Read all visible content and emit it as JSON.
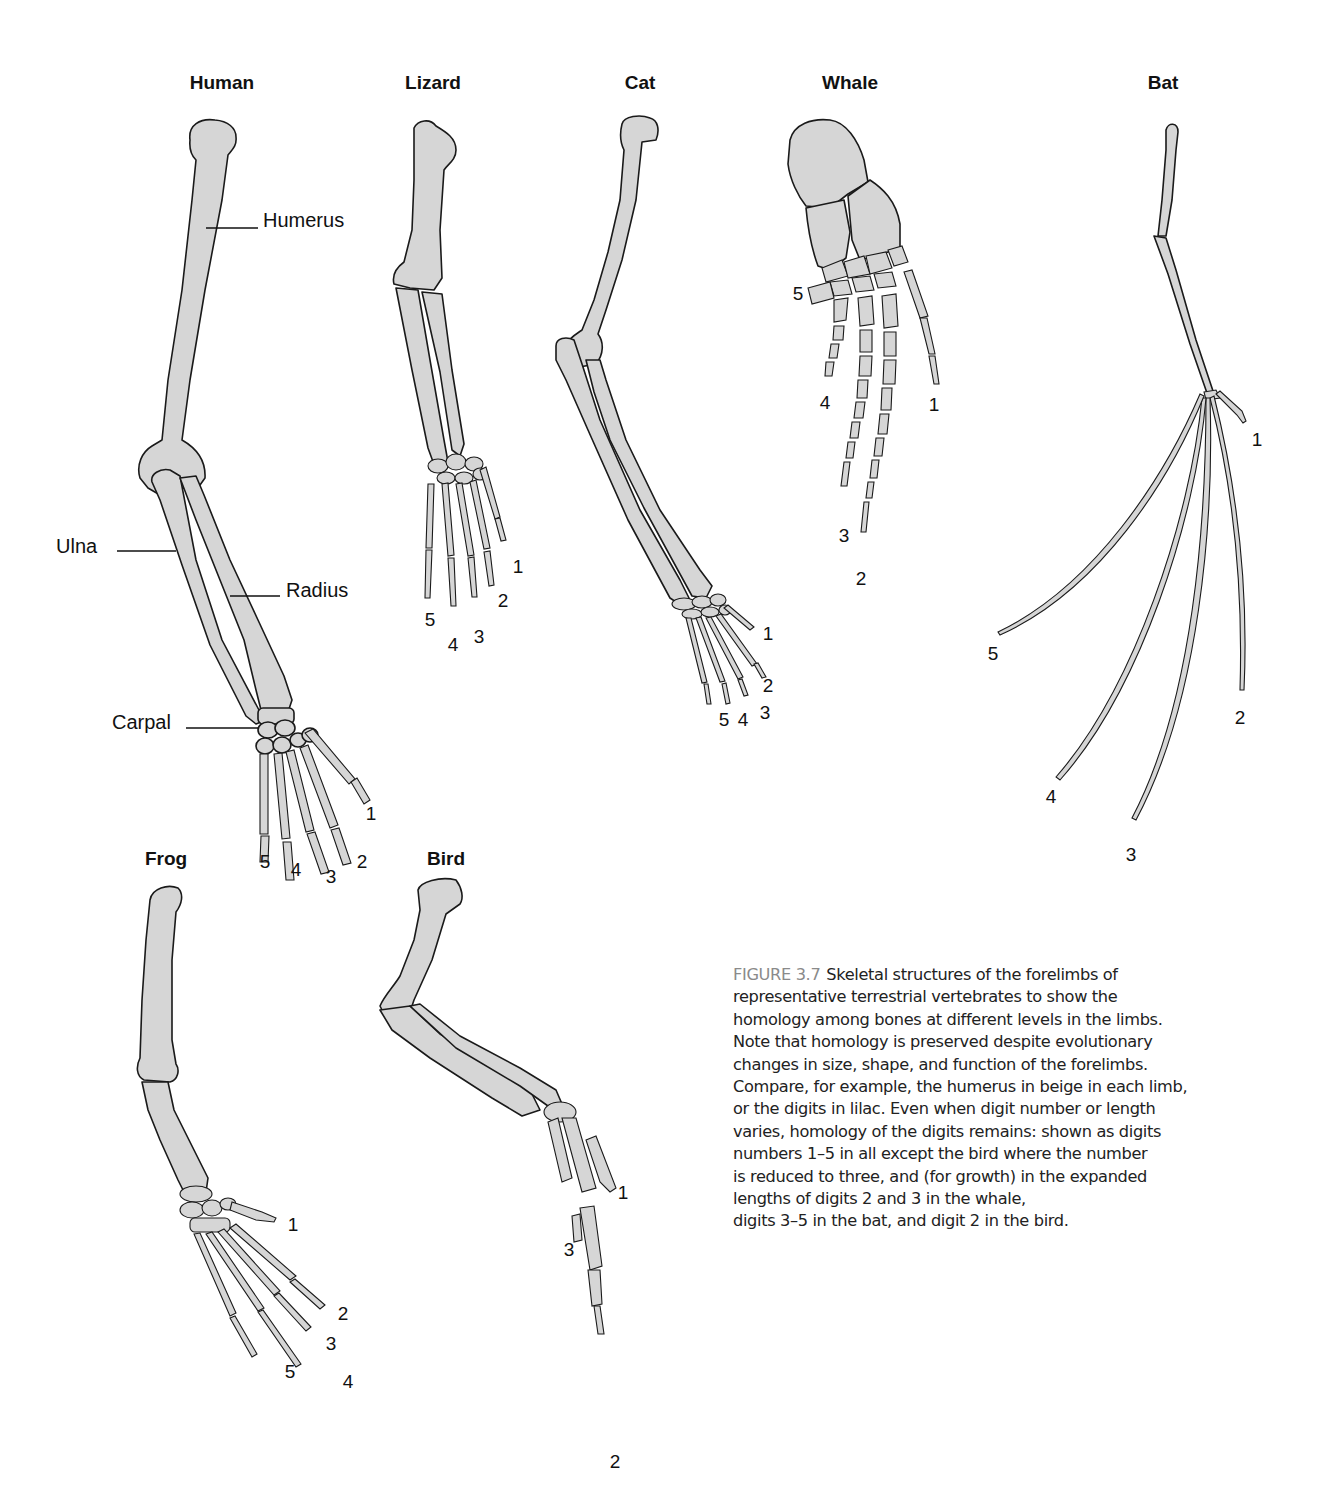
{
  "figure": {
    "number": "FIGURE 3.7",
    "caption_lines": [
      "Skeletal structures of the forelimbs of",
      "representative terrestrial vertebrates to show the",
      "homology among bones at different levels in the limbs.",
      "Note that homology is preserved despite evolutionary",
      "changes in size, shape, and function of the forelimbs.",
      "Compare, for example, the humerus in beige in each limb,",
      "or the digits in lilac. Even when digit number or length",
      "varies, homology of the digits remains: shown as digits",
      "numbers 1–5 in all except the bird where the number",
      "is reduced to three, and (for growth) in the expanded",
      "lengths of digits 2 and 3 in the whale,",
      "digits 3–5 in the bat, and digit 2 in the bird."
    ],
    "colors": {
      "bone_fill": "#d6d6d6",
      "outline": "#1a1a1a",
      "figure_number": "#8a8a8a",
      "text": "#222222"
    }
  },
  "limbs": {
    "human": {
      "title": "Human",
      "labels": {
        "humerus": "Humerus",
        "ulna": "Ulna",
        "radius": "Radius",
        "carpal": "Carpal"
      },
      "digits": [
        "1",
        "2",
        "3",
        "4",
        "5"
      ]
    },
    "lizard": {
      "title": "Lizard",
      "digits": [
        "1",
        "2",
        "3",
        "4",
        "5"
      ]
    },
    "cat": {
      "title": "Cat",
      "digits": [
        "1",
        "2",
        "3",
        "4",
        "5"
      ]
    },
    "whale": {
      "title": "Whale",
      "digits": [
        "1",
        "2",
        "3",
        "4",
        "5"
      ]
    },
    "bat": {
      "title": "Bat",
      "digits": [
        "1",
        "2",
        "3",
        "4",
        "5"
      ]
    },
    "frog": {
      "title": "Frog",
      "digits": [
        "1",
        "2",
        "3",
        "4",
        "5"
      ]
    },
    "bird": {
      "title": "Bird",
      "digits": [
        "1",
        "2",
        "3"
      ]
    }
  }
}
